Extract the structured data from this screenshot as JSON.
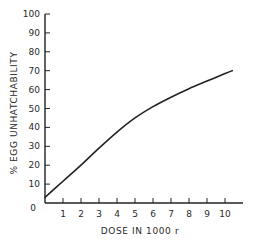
{
  "chart_data": {
    "type": "line",
    "title": "",
    "xlabel": "DOSE IN 1000 r",
    "ylabel": "% EGG UNHATCHABILITY",
    "xlim": [
      0,
      10.9
    ],
    "ylim": [
      0,
      100
    ],
    "xticks": [
      "0",
      "1",
      "2",
      "3",
      "4",
      "5",
      "6",
      "7",
      "8",
      "9",
      "10"
    ],
    "yticks": [
      "0",
      "10",
      "20",
      "30",
      "40",
      "50",
      "60",
      "70",
      "80",
      "90",
      "100"
    ],
    "grid": false,
    "legend": null,
    "series": [
      {
        "name": "unhatchability",
        "x": [
          0,
          1,
          2,
          3,
          4,
          5,
          6,
          7,
          8,
          9,
          10,
          10.4
        ],
        "y": [
          3,
          11.5,
          20,
          29,
          37.5,
          45,
          51,
          56,
          60.5,
          64.5,
          68.5,
          70
        ]
      }
    ],
    "colors": {
      "line": "#222222",
      "axis": "#222222"
    }
  }
}
